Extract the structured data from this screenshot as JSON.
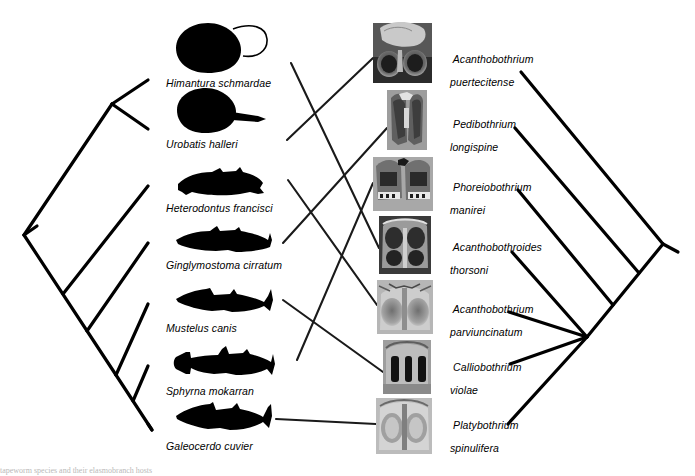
{
  "figure": {
    "type": "cophylogeny-tanglegram",
    "background_color": "#ffffff",
    "line_color": "#000000",
    "width": 695,
    "height": 476,
    "caption_fragment": "tapeworm species and their elasmobranch hosts"
  },
  "host_tree": {
    "title": "Elasmobranch host phylogeny",
    "orientation": "root-left",
    "root": {
      "x": 24,
      "y": 235
    },
    "taxa": [
      {
        "id": "himantura",
        "name": "Himantura schmardae",
        "label_x": 166,
        "label_y": 78,
        "tip_x": 148,
        "tip_y": 80,
        "silhouette": "stingray-whiptail",
        "sil_x": 176,
        "sil_y": 22,
        "sil_w": 66,
        "sil_h": 50
      },
      {
        "id": "urobatis",
        "name": "Urobatis halleri",
        "label_x": 166,
        "label_y": 139,
        "tip_x": 148,
        "tip_y": 129,
        "silhouette": "stingray-shorttail",
        "sil_x": 180,
        "sil_y": 88,
        "sil_w": 62,
        "sil_h": 45
      },
      {
        "id": "heterodontus",
        "name": "Heterodontus francisci",
        "label_x": 166,
        "label_y": 203,
        "tip_x": 148,
        "tip_y": 186,
        "silhouette": "shark-bullhead",
        "sil_x": 176,
        "sil_y": 168,
        "sil_w": 88,
        "sil_h": 28
      },
      {
        "id": "ginglymostoma",
        "name": "Ginglymostoma cirratum",
        "label_x": 166,
        "label_y": 260,
        "tip_x": 148,
        "tip_y": 243,
        "silhouette": "shark-nurse",
        "sil_x": 176,
        "sil_y": 226,
        "sil_w": 94,
        "sil_h": 26
      },
      {
        "id": "mustelus",
        "name": "Mustelus canis",
        "label_x": 166,
        "label_y": 323,
        "tip_x": 148,
        "tip_y": 304,
        "silhouette": "shark-smoothhound",
        "sil_x": 176,
        "sil_y": 288,
        "sil_w": 98,
        "sil_h": 26
      },
      {
        "id": "sphyrna",
        "name": "Sphyrna mokarran",
        "label_x": 166,
        "label_y": 386,
        "tip_x": 148,
        "tip_y": 366,
        "silhouette": "shark-hammerhead",
        "sil_x": 176,
        "sil_y": 348,
        "sil_w": 98,
        "sil_h": 28
      },
      {
        "id": "galeocerdo",
        "name": "Galeocerdo cuvier",
        "label_x": 166,
        "label_y": 441,
        "tip_x": 148,
        "tip_y": 424,
        "silhouette": "shark-tiger",
        "sil_x": 176,
        "sil_y": 404,
        "sil_w": 96,
        "sil_h": 28
      }
    ]
  },
  "parasite_tree": {
    "title": "Tapeworm parasite phylogeny",
    "orientation": "root-right",
    "root": {
      "x": 678,
      "y": 252
    },
    "polytomy_node": {
      "x": 587,
      "y": 337
    },
    "taxa": [
      {
        "id": "a-puertecitense",
        "name_line1": "Acanthobothrium",
        "name_line2": "puertecitense",
        "label_x": 441,
        "label_y": 48,
        "tip_x": 521,
        "tip_y": 72,
        "img_x": 373,
        "img_y": 23,
        "img_w": 59,
        "img_h": 60,
        "image_kind": "sem-bothridia-pair-dark"
      },
      {
        "id": "p-longispine",
        "name_line1": "Pedibothrium",
        "name_line2": "longispine",
        "label_x": 441,
        "label_y": 113,
        "tip_x": 515,
        "tip_y": 128,
        "img_x": 387,
        "img_y": 90,
        "img_w": 40,
        "img_h": 60,
        "image_kind": "sem-bothridia-tall"
      },
      {
        "id": "p-manirei",
        "name_line1": "Phoreiobothrium",
        "name_line2": "manirei",
        "label_x": 441,
        "label_y": 176,
        "tip_x": 518,
        "tip_y": 190,
        "img_x": 373,
        "img_y": 157,
        "img_w": 60,
        "img_h": 54,
        "image_kind": "sem-bothridia-ribbed"
      },
      {
        "id": "a-thorsoni",
        "name_line1": "Acanthobothroides",
        "name_line2": "thorsoni",
        "label_x": 441,
        "label_y": 236,
        "tip_x": 512,
        "tip_y": 252,
        "img_x": 379,
        "img_y": 216,
        "img_w": 52,
        "img_h": 58,
        "image_kind": "sem-bothridia-four-loculi"
      },
      {
        "id": "a-parviuncinatum",
        "name_line1": "Acanthobothrium",
        "name_line2": "parviuncinatum",
        "label_x": 441,
        "label_y": 298,
        "tip_x": 509,
        "tip_y": 312,
        "img_x": 377,
        "img_y": 280,
        "img_w": 56,
        "img_h": 54,
        "image_kind": "sem-bothridia-light"
      },
      {
        "id": "c-violae",
        "name_line1": "Calliobothrium",
        "name_line2": "violae",
        "label_x": 441,
        "label_y": 356,
        "tip_x": 510,
        "tip_y": 364,
        "img_x": 383,
        "img_y": 340,
        "img_w": 48,
        "img_h": 54,
        "image_kind": "sem-bothridia-slits"
      },
      {
        "id": "p-spinulifera",
        "name_line1": "Platybothrium",
        "name_line2": "spinulifera",
        "label_x": 441,
        "label_y": 414,
        "tip_x": 508,
        "tip_y": 424,
        "img_x": 376,
        "img_y": 398,
        "img_w": 56,
        "img_h": 56,
        "image_kind": "sem-bothridia-oval"
      }
    ]
  },
  "associations": [
    {
      "host": "himantura",
      "parasite": "a-thorsoni"
    },
    {
      "host": "urobatis",
      "parasite": "a-puertecitense"
    },
    {
      "host": "heterodontus",
      "parasite": "a-parviuncinatum"
    },
    {
      "host": "ginglymostoma",
      "parasite": "p-longispine"
    },
    {
      "host": "mustelus",
      "parasite": "c-violae"
    },
    {
      "host": "sphyrna",
      "parasite": "p-manirei"
    },
    {
      "host": "galeocerdo",
      "parasite": "p-spinulifera"
    }
  ]
}
